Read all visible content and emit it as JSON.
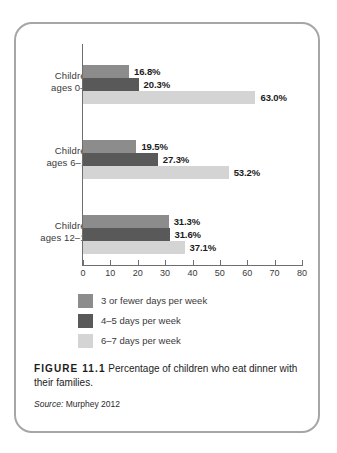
{
  "figure": {
    "label": "FIGURE 11.1",
    "caption": "Percentage of children who eat dinner with their families.",
    "source_word": "Source:",
    "source_value": "Murphey 2012"
  },
  "chart_data": {
    "type": "bar",
    "orientation": "horizontal",
    "title": "",
    "xlabel": "",
    "ylabel": "",
    "xlim": [
      0,
      80
    ],
    "xticks": [
      0,
      10,
      20,
      30,
      40,
      50,
      60,
      70,
      80
    ],
    "xtick_labels": [
      "0",
      "10",
      "20",
      "30",
      "40",
      "50",
      "60",
      "70",
      "80"
    ],
    "grid": false,
    "legend_position": "below-axis-left",
    "categories": [
      "Children ages 0–5",
      "Children ages 6–11",
      "Children ages 12–17"
    ],
    "category_lines": [
      [
        "Children",
        "ages 0–5"
      ],
      [
        "Children",
        "ages 6–11"
      ],
      [
        "Children",
        "ages 12–17"
      ]
    ],
    "series": [
      {
        "name": "3 or fewer days per week",
        "color": "#8c8c8c",
        "values": [
          16.8,
          19.5,
          31.3
        ],
        "labels": [
          "16.8%",
          "19.5%",
          "31.3%"
        ]
      },
      {
        "name": "4–5 days per week",
        "color": "#595959",
        "values": [
          20.3,
          27.3,
          31.6
        ],
        "labels": [
          "20.3%",
          "27.3%",
          "31.6%"
        ]
      },
      {
        "name": "6–7 days per week",
        "color": "#d4d4d4",
        "values": [
          63.0,
          53.2,
          37.1
        ],
        "labels": [
          "63.0%",
          "53.2%",
          "37.1%"
        ]
      }
    ]
  }
}
